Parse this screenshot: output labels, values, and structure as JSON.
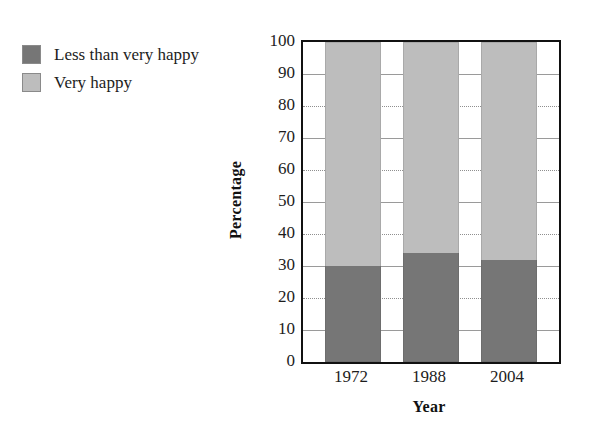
{
  "legend": {
    "items": [
      {
        "label": "Less than very happy",
        "color": "#767676",
        "swatch_name": "legend-swatch-less-than-very-happy"
      },
      {
        "label": "Very happy",
        "color": "#bdbdbd",
        "swatch_name": "legend-swatch-very-happy"
      }
    ]
  },
  "chart_data": {
    "type": "bar",
    "subtype": "stacked-100-percent",
    "title": "",
    "subtitle": "",
    "xlabel": "Year",
    "ylabel": "Percentage",
    "categories": [
      "1972",
      "1988",
      "2004"
    ],
    "series": [
      {
        "name": "Less than very happy",
        "color": "#767676",
        "values": [
          30,
          34,
          32
        ]
      },
      {
        "name": "Very happy",
        "color": "#bdbdbd",
        "values": [
          70,
          66,
          68
        ]
      }
    ],
    "ylim": [
      0,
      100
    ],
    "ytick_step": 10,
    "yticks": [
      100,
      90,
      80,
      70,
      60,
      50,
      40,
      30,
      20,
      10,
      0
    ],
    "ytick_labels": [
      "100",
      "90",
      "80",
      "70",
      "60",
      "50",
      "40",
      "30",
      "20",
      "10",
      "0"
    ],
    "xticks": [
      "1972",
      "1988",
      "2004"
    ],
    "grid": true,
    "grid_axis": "y",
    "legend_position": "top-left-outside",
    "frame": true
  }
}
